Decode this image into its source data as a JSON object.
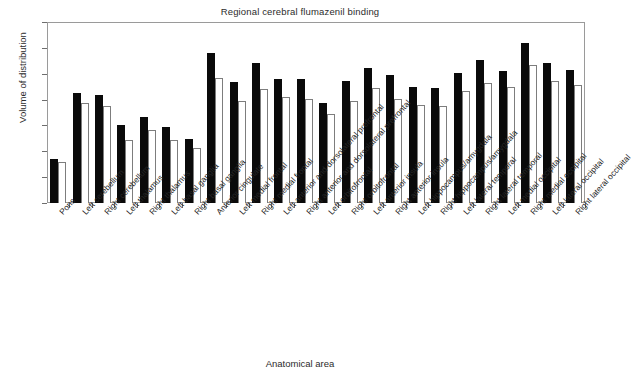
{
  "chart_data": {
    "type": "bar",
    "title": "Regional cerebral flumazenil binding",
    "xlabel": "Anatomical area",
    "ylabel": "Volume of distribution",
    "ylim": [
      0,
      7
    ],
    "yticks": [
      0,
      1,
      2,
      3,
      4,
      5,
      6,
      7
    ],
    "grid": false,
    "legend": "none",
    "orientation": "vertical",
    "bar_style": {
      "series_1_fill": "#0a0a0a",
      "series_2_fill": "#ffffff",
      "series_2_stroke": "#7d7d7d",
      "frame_color": "#9a9a9a"
    },
    "categories": [
      "Pons",
      "Left cerebellum",
      "Right cerebellum",
      "Left thalamus",
      "Right thalamus",
      "Left basal ganglia",
      "Right basal ganglia",
      "Anterior cingulate",
      "Left medial frontal",
      "Right medial frontal",
      "Left anterior and dorsolateral prefrontal",
      "Right anterior and dorsolateral prefrontal",
      "Left orbitofrontal",
      "Right orbitofrontal",
      "Left anterior insula",
      "Right anterior insula",
      "Left hippocampus/amygdala",
      "Right hippocampus/amygdala",
      "Left lateral temporal",
      "Right lateral temporal",
      "Left medial occipital",
      "Right medial occipital",
      "Left lateral occipital",
      "Right lateral occipital"
    ],
    "series": [
      {
        "name": "series-1",
        "fill": "black",
        "values": [
          1.72,
          4.26,
          4.19,
          3.02,
          3.34,
          2.95,
          2.47,
          5.8,
          4.67,
          5.4,
          4.78,
          4.78,
          3.86,
          4.7,
          5.22,
          4.95,
          4.47,
          4.43,
          5.02,
          5.55,
          5.11,
          6.2,
          5.41,
          5.15
        ]
      },
      {
        "name": "series-2",
        "fill": "white",
        "values": [
          1.6,
          3.88,
          3.75,
          2.43,
          2.81,
          2.42,
          2.11,
          4.83,
          3.95,
          4.42,
          4.11,
          4.02,
          3.46,
          3.95,
          4.43,
          4.03,
          3.79,
          3.75,
          4.35,
          4.66,
          4.48,
          5.35,
          4.7,
          4.55
        ]
      }
    ]
  }
}
